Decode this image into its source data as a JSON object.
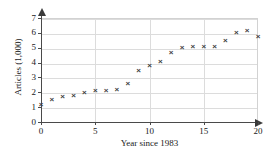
{
  "chart_data": {
    "type": "scatter",
    "title": "",
    "xlabel": "Year since 1983",
    "ylabel": "Articles (1,000)",
    "xlim": [
      0,
      20
    ],
    "ylim": [
      0,
      7
    ],
    "xticks": [
      0,
      5,
      10,
      15,
      20
    ],
    "yticks": [
      0,
      1,
      2,
      3,
      4,
      5,
      6,
      7
    ],
    "xtick_labels": [
      "0",
      "5",
      "10",
      "15",
      "20"
    ],
    "ytick_labels": [
      "0",
      "1",
      "2",
      "3",
      "4",
      "5",
      "6",
      "7"
    ],
    "grid": true,
    "legend": null,
    "marker": "x",
    "marker_color": "#3d3d3d",
    "x": [
      0,
      1,
      2,
      3,
      4,
      5,
      6,
      7,
      8,
      9,
      10,
      11,
      12,
      13,
      14,
      15,
      16,
      17,
      18,
      19,
      20
    ],
    "values": [
      1.2,
      1.5,
      1.7,
      1.8,
      2.0,
      2.1,
      2.15,
      2.2,
      2.6,
      3.5,
      3.8,
      4.05,
      4.65,
      5.0,
      5.05,
      5.1,
      5.05,
      5.5,
      6.05,
      6.15,
      5.75
    ]
  }
}
